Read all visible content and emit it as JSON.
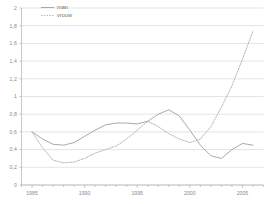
{
  "chart_data": {
    "type": "line",
    "title": "",
    "xlabel": "",
    "ylabel": "",
    "ylim": [
      0,
      2
    ],
    "xlim": [
      1984,
      2007
    ],
    "grid": "horizontal",
    "legend_position": "top-left",
    "y_ticks": [
      "0",
      "0,2",
      "0,4",
      "0,6",
      "0,8",
      "1",
      "1,2",
      "1,4",
      "1,6",
      "1,8",
      "2"
    ],
    "y_tick_values": [
      0,
      0.2,
      0.4,
      0.6,
      0.8,
      1,
      1.2,
      1.4,
      1.6,
      1.8,
      2
    ],
    "x_ticks": [
      "1985",
      "1990",
      "1995",
      "2000",
      "2005"
    ],
    "x_tick_values": [
      1985,
      1990,
      1995,
      2000,
      2005
    ],
    "x_minor_step": 1,
    "series": [
      {
        "name": "man",
        "style": "solid",
        "color": "#9a9a9a",
        "x": [
          1985,
          1986,
          1987,
          1988,
          1989,
          1990,
          1991,
          1992,
          1993,
          1994,
          1995,
          1996,
          1997,
          1998,
          1999,
          2000,
          2001,
          2002,
          2003,
          2004,
          2005,
          2006
        ],
        "values": [
          0.6,
          0.52,
          0.46,
          0.45,
          0.48,
          0.55,
          0.62,
          0.68,
          0.7,
          0.7,
          0.69,
          0.72,
          0.8,
          0.85,
          0.78,
          0.62,
          0.45,
          0.33,
          0.3,
          0.4,
          0.47,
          0.45
        ]
      },
      {
        "name": "vrouw",
        "style": "dotted",
        "color": "#a8a8a8",
        "x": [
          1985,
          1986,
          1987,
          1988,
          1989,
          1990,
          1991,
          1992,
          1993,
          1994,
          1995,
          1996,
          1997,
          1998,
          1999,
          2000,
          2001,
          2002,
          2003,
          2004,
          2005,
          2006
        ],
        "values": [
          0.6,
          0.42,
          0.28,
          0.25,
          0.26,
          0.3,
          0.36,
          0.4,
          0.44,
          0.52,
          0.62,
          0.72,
          0.66,
          0.58,
          0.52,
          0.48,
          0.52,
          0.66,
          0.88,
          1.12,
          1.42,
          1.74
        ]
      }
    ]
  },
  "legend": {
    "items": [
      {
        "label": "man"
      },
      {
        "label": "vrouw"
      }
    ]
  }
}
